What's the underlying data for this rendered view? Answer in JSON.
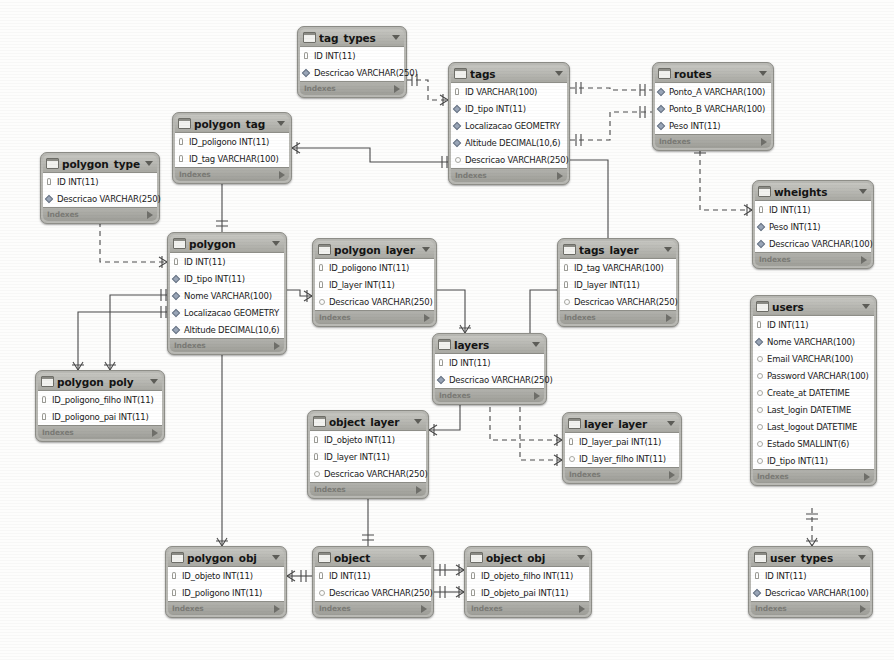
{
  "diagram": {
    "tool": "MySQL Workbench",
    "footer_label": "Indexes",
    "colors": {
      "table_header": "#b9b9b4",
      "table_body": "#ffffff",
      "border": "#8e8e88",
      "connector": "#555555",
      "background": "#fdfdfc"
    }
  },
  "tables": [
    {
      "name": "tag_types",
      "x": 297,
      "y": 26,
      "w": 110,
      "columns": [
        {
          "label": "ID INT(11)",
          "key": "pk"
        },
        {
          "label": "Descricao VARCHAR(250)",
          "key": "fk"
        }
      ]
    },
    {
      "name": "tags",
      "x": 448,
      "y": 62,
      "w": 122,
      "columns": [
        {
          "label": "ID VARCHAR(100)",
          "key": "pk"
        },
        {
          "label": "ID_tipo INT(11)",
          "key": "fk"
        },
        {
          "label": "Localizacao GEOMETRY",
          "key": "fk"
        },
        {
          "label": "Altitude DECIMAL(10,6)",
          "key": "fk"
        },
        {
          "label": "Descricao VARCHAR(250)",
          "key": "plain"
        }
      ]
    },
    {
      "name": "routes",
      "x": 652,
      "y": 62,
      "w": 122,
      "columns": [
        {
          "label": "Ponto_A VARCHAR(100)",
          "key": "fk"
        },
        {
          "label": "Ponto_B VARCHAR(100)",
          "key": "fk"
        },
        {
          "label": "Peso INT(11)",
          "key": "fk"
        }
      ]
    },
    {
      "name": "polygon_tag",
      "x": 172,
      "y": 112,
      "w": 120,
      "columns": [
        {
          "label": "ID_poligono INT(11)",
          "key": "pk"
        },
        {
          "label": "ID_tag VARCHAR(100)",
          "key": "pk"
        }
      ]
    },
    {
      "name": "polygon_type",
      "x": 40,
      "y": 152,
      "w": 120,
      "columns": [
        {
          "label": "ID INT(11)",
          "key": "pk"
        },
        {
          "label": "Descricao VARCHAR(250)",
          "key": "fk"
        }
      ]
    },
    {
      "name": "wheights",
      "x": 752,
      "y": 180,
      "w": 122,
      "columns": [
        {
          "label": "ID INT(11)",
          "key": "pk"
        },
        {
          "label": "Peso INT(11)",
          "key": "fk"
        },
        {
          "label": "Descricao VARCHAR(100)",
          "key": "fk"
        }
      ]
    },
    {
      "name": "polygon",
      "x": 167,
      "y": 232,
      "w": 120,
      "columns": [
        {
          "label": "ID INT(11)",
          "key": "pk"
        },
        {
          "label": "ID_tipo INT(11)",
          "key": "fk"
        },
        {
          "label": "Nome VARCHAR(100)",
          "key": "fk"
        },
        {
          "label": "Localizacao GEOMETRY",
          "key": "fk"
        },
        {
          "label": "Altitude DECIMAL(10,6)",
          "key": "fk"
        }
      ]
    },
    {
      "name": "polygon_layer",
      "x": 312,
      "y": 238,
      "w": 125,
      "columns": [
        {
          "label": "ID_poligono INT(11)",
          "key": "pk"
        },
        {
          "label": "ID_layer INT(11)",
          "key": "pk"
        },
        {
          "label": "Descricao VARCHAR(250)",
          "key": "plain"
        }
      ]
    },
    {
      "name": "tags_layer",
      "x": 557,
      "y": 238,
      "w": 122,
      "columns": [
        {
          "label": "ID_tag VARCHAR(100)",
          "key": "pk"
        },
        {
          "label": "ID_layer INT(11)",
          "key": "pk"
        },
        {
          "label": "Descricao VARCHAR(250)",
          "key": "plain"
        }
      ]
    },
    {
      "name": "users",
      "x": 750,
      "y": 295,
      "w": 127,
      "columns": [
        {
          "label": "ID INT(11)",
          "key": "pk"
        },
        {
          "label": "Nome VARCHAR(100)",
          "key": "fk"
        },
        {
          "label": "Email VARCHAR(100)",
          "key": "plain"
        },
        {
          "label": "Password VARCHAR(100)",
          "key": "plain"
        },
        {
          "label": "Create_at DATETIME",
          "key": "plain"
        },
        {
          "label": "Last_login DATETIME",
          "key": "plain"
        },
        {
          "label": "Last_logout DATETIME",
          "key": "plain"
        },
        {
          "label": "Estado SMALLINT(6)",
          "key": "plain"
        },
        {
          "label": "ID_tipo INT(11)",
          "key": "plain"
        }
      ]
    },
    {
      "name": "layers",
      "x": 432,
      "y": 333,
      "w": 115,
      "columns": [
        {
          "label": "ID INT(11)",
          "key": "pk"
        },
        {
          "label": "Descricao VARCHAR(250)",
          "key": "fk"
        }
      ]
    },
    {
      "name": "polygon_poly",
      "x": 35,
      "y": 370,
      "w": 130,
      "columns": [
        {
          "label": "ID_poligono_filho INT(11)",
          "key": "pk"
        },
        {
          "label": "ID_poligono_pai INT(11)",
          "key": "pk"
        }
      ]
    },
    {
      "name": "object_layer",
      "x": 307,
      "y": 410,
      "w": 122,
      "columns": [
        {
          "label": "ID_objeto INT(11)",
          "key": "pk"
        },
        {
          "label": "ID_layer INT(11)",
          "key": "pk"
        },
        {
          "label": "Descricao VARCHAR(250)",
          "key": "plain"
        }
      ]
    },
    {
      "name": "layer_layer",
      "x": 562,
      "y": 412,
      "w": 120,
      "columns": [
        {
          "label": "ID_layer_pai INT(11)",
          "key": "pk"
        },
        {
          "label": "ID_layer_filho INT(11)",
          "key": "plain"
        }
      ]
    },
    {
      "name": "polygon_obj",
      "x": 165,
      "y": 546,
      "w": 122,
      "columns": [
        {
          "label": "ID_objeto INT(11)",
          "key": "pk"
        },
        {
          "label": "ID_poligono INT(11)",
          "key": "pk"
        }
      ]
    },
    {
      "name": "object",
      "x": 312,
      "y": 546,
      "w": 122,
      "columns": [
        {
          "label": "ID INT(11)",
          "key": "pk"
        },
        {
          "label": "Descricao VARCHAR(250)",
          "key": "plain"
        }
      ]
    },
    {
      "name": "object_obj",
      "x": 464,
      "y": 546,
      "w": 128,
      "columns": [
        {
          "label": "ID_objeto_filho INT(11)",
          "key": "pk"
        },
        {
          "label": "ID_objeto_pai INT(11)",
          "key": "pk"
        }
      ]
    },
    {
      "name": "user_types",
      "x": 748,
      "y": 546,
      "w": 125,
      "columns": [
        {
          "label": "ID INT(11)",
          "key": "pk"
        },
        {
          "label": "Descricao VARCHAR(100)",
          "key": "fk"
        }
      ]
    }
  ],
  "relationships": [
    {
      "from": "tag_types",
      "to": "tags",
      "style": "dashed"
    },
    {
      "from": "tags",
      "to": "routes",
      "style": "dashed"
    },
    {
      "from": "polygon_tag",
      "to": "tags",
      "style": "solid"
    },
    {
      "from": "polygon_type",
      "to": "polygon",
      "style": "dashed"
    },
    {
      "from": "polygon_tag",
      "to": "polygon",
      "style": "solid"
    },
    {
      "from": "polygon",
      "to": "polygon_layer",
      "style": "solid"
    },
    {
      "from": "polygon",
      "to": "polygon_poly",
      "style": "solid"
    },
    {
      "from": "polygon",
      "to": "polygon_obj",
      "style": "solid"
    },
    {
      "from": "polygon_layer",
      "to": "layers",
      "style": "solid"
    },
    {
      "from": "tags_layer",
      "to": "layers",
      "style": "solid"
    },
    {
      "from": "tags",
      "to": "tags_layer",
      "style": "solid"
    },
    {
      "from": "routes",
      "to": "wheights",
      "style": "dashed"
    },
    {
      "from": "layers",
      "to": "object_layer",
      "style": "solid"
    },
    {
      "from": "layers",
      "to": "layer_layer",
      "style": "dashed"
    },
    {
      "from": "object",
      "to": "object_layer",
      "style": "solid"
    },
    {
      "from": "object",
      "to": "polygon_obj",
      "style": "solid"
    },
    {
      "from": "object",
      "to": "object_obj",
      "style": "solid"
    },
    {
      "from": "users",
      "to": "user_types",
      "style": "dashed"
    }
  ]
}
